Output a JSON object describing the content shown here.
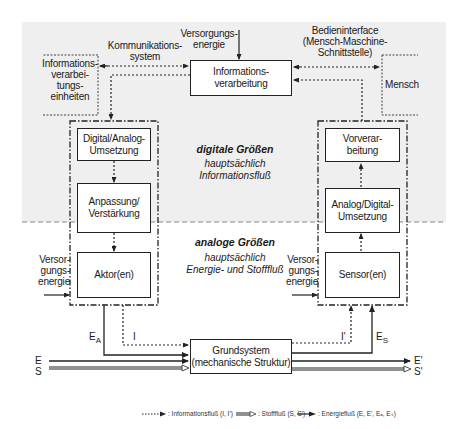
{
  "regions": {
    "digital": {
      "title": "digitale Größen",
      "subtitle": "hauptsächlich\nInformationsfluß"
    },
    "analog": {
      "title": "analoge Größen",
      "subtitle": "hauptsächlich\nEnergie- und Stofffluß"
    }
  },
  "top": {
    "kommunikationssystem": "Kommunikations-\nsystem",
    "versorgungsenergie": "Versorgungs-\nenergie",
    "bedieninterface": "Bedieninterface\n(Mensch-Maschine-\nSchnittstelle)",
    "informationsverarbeitung": "Informations-\nverarbeitung",
    "informationsverarbeitungseinheiten": "Informations-\nverarbei-\ntungs-\neinheiten",
    "mensch": "Mensch"
  },
  "actuator_chain": {
    "da_umsetzung": "Digital/Analog-\nUmsetzung",
    "anpassung": "Anpassung/\nVerstärkung",
    "aktor": "Aktor(en)",
    "versorgungsenergie": "Versor-\ngungs-\nenergie"
  },
  "sensor_chain": {
    "vorverarbeitung": "Vorverar-\nbeitung",
    "ad_umsetzung": "Analog/Digital-\nUmsetzung",
    "sensor": "Sensor(en)",
    "versorgungsenergie": "Versor-\ngungs-\nenergie"
  },
  "bottom": {
    "grundsystem": "Grundsystem\n(mechanische Struktur)",
    "E_A": "E",
    "E_A_sub": "A",
    "E_S": "E",
    "E_S_sub": "S",
    "I": "I",
    "I_prime": "I'",
    "E_in": "E",
    "S_in": "S",
    "E_out": "E'",
    "S_out": "S'"
  },
  "legend": {
    "information": ": Informationsfluß (I, I')",
    "stoff": ": Stofffluß (S, S')",
    "energie": ": Energiefluß (E, E', Eₐ, Eₛ)"
  },
  "colors": {
    "background_digital": "#efefef",
    "line": "#222222",
    "background": "#ffffff"
  }
}
